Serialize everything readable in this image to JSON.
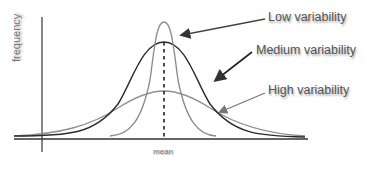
{
  "diagram": {
    "title": "",
    "y_axis_label": "frequency",
    "x_axis_label": "mean",
    "curves": [
      {
        "name": "Low variability",
        "label": "Low variability",
        "color": "#8a8a8a",
        "peak_y": 22
      },
      {
        "name": "Medium variability",
        "label": "Medium variability",
        "color": "#2b2b2b",
        "peak_y": 42
      },
      {
        "name": "High variability",
        "label": "High variability",
        "color": "#8f8f8f",
        "peak_y": 91
      }
    ],
    "colors": {
      "axis": "#333333",
      "text": "#555555",
      "arrow": "#333333"
    }
  }
}
